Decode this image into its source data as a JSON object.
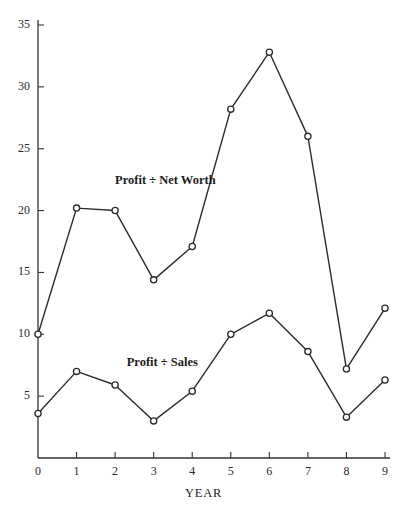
{
  "chart_data": {
    "type": "line",
    "title": "",
    "subtitle": "",
    "xlabel": "YEAR",
    "ylabel": "",
    "x": [
      0,
      1,
      2,
      3,
      4,
      5,
      6,
      7,
      8,
      9
    ],
    "xlim": [
      0,
      9
    ],
    "ylim": [
      0,
      35
    ],
    "xticks": [
      0,
      1,
      2,
      3,
      4,
      5,
      6,
      7,
      8,
      9
    ],
    "xticklabels": [
      "0",
      "1",
      "2",
      "3",
      "4",
      "5",
      "6",
      "7",
      "8",
      "9"
    ],
    "yticks": [
      5,
      10,
      15,
      20,
      25,
      30,
      35
    ],
    "yticklabels": [
      "5",
      "10",
      "15",
      "20",
      "25",
      "30",
      "35"
    ],
    "grid": false,
    "legend_position": "inline-annotation",
    "marker": "open-circle",
    "line_color": "#2b2b2b",
    "axis_color": "#333333",
    "background_color": "#ffffff",
    "series": [
      {
        "name": "Profit ÷ Net Worth",
        "values": [
          10.0,
          20.2,
          20.0,
          14.4,
          17.1,
          28.2,
          32.8,
          26.0,
          7.2,
          12.1
        ],
        "label_x": 2.0,
        "label_y": 22.3
      },
      {
        "name": "Profit ÷ Sales",
        "values": [
          3.6,
          7.0,
          5.9,
          3.0,
          5.4,
          10.0,
          11.7,
          8.6,
          3.3,
          6.3
        ],
        "label_x": 2.3,
        "label_y": 7.6
      }
    ],
    "annotations": [
      {
        "text": "Profit ÷ Net Worth",
        "x": 2.0,
        "y": 22.3
      },
      {
        "text": "Profit ÷ Sales",
        "x": 2.3,
        "y": 7.6
      }
    ]
  }
}
